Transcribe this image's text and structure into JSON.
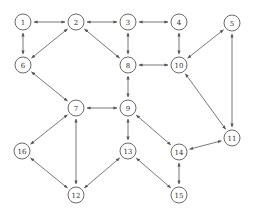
{
  "diagram": {
    "type": "directed-graph",
    "edge_style": "bidirectional-arrows",
    "colors": {
      "stroke": "#555555",
      "node_fill": "#ffffff",
      "text": "#333333"
    },
    "node_radius": 8,
    "nodes": [
      {
        "id": "1",
        "label": "1",
        "x": 23,
        "y": 22
      },
      {
        "id": "2",
        "label": "2",
        "x": 76,
        "y": 22
      },
      {
        "id": "3",
        "label": "3",
        "x": 128,
        "y": 22
      },
      {
        "id": "4",
        "label": "4",
        "x": 179,
        "y": 22
      },
      {
        "id": "5",
        "label": "5",
        "x": 232,
        "y": 23
      },
      {
        "id": "6",
        "label": "6",
        "x": 23,
        "y": 65
      },
      {
        "id": "7",
        "label": "7",
        "x": 76,
        "y": 108
      },
      {
        "id": "8",
        "label": "8",
        "x": 128,
        "y": 65
      },
      {
        "id": "9",
        "label": "9",
        "x": 128,
        "y": 108
      },
      {
        "id": "10",
        "label": "10",
        "x": 179,
        "y": 65
      },
      {
        "id": "11",
        "label": "11",
        "x": 232,
        "y": 138
      },
      {
        "id": "12",
        "label": "12",
        "x": 76,
        "y": 195
      },
      {
        "id": "13",
        "label": "13",
        "x": 128,
        "y": 151
      },
      {
        "id": "14",
        "label": "14",
        "x": 179,
        "y": 152
      },
      {
        "id": "15",
        "label": "15",
        "x": 179,
        "y": 195
      },
      {
        "id": "16",
        "label": "16",
        "x": 22,
        "y": 151
      }
    ],
    "edges": [
      {
        "from": "1",
        "to": "2"
      },
      {
        "from": "2",
        "to": "3"
      },
      {
        "from": "3",
        "to": "4"
      },
      {
        "from": "1",
        "to": "6"
      },
      {
        "from": "2",
        "to": "6"
      },
      {
        "from": "2",
        "to": "8"
      },
      {
        "from": "3",
        "to": "8"
      },
      {
        "from": "4",
        "to": "10"
      },
      {
        "from": "8",
        "to": "10"
      },
      {
        "from": "5",
        "to": "10"
      },
      {
        "from": "5",
        "to": "11"
      },
      {
        "from": "10",
        "to": "11"
      },
      {
        "from": "6",
        "to": "7"
      },
      {
        "from": "7",
        "to": "9"
      },
      {
        "from": "8",
        "to": "9"
      },
      {
        "from": "9",
        "to": "13"
      },
      {
        "from": "9",
        "to": "14"
      },
      {
        "from": "11",
        "to": "14"
      },
      {
        "from": "7",
        "to": "16"
      },
      {
        "from": "7",
        "to": "12"
      },
      {
        "from": "16",
        "to": "12"
      },
      {
        "from": "12",
        "to": "13"
      },
      {
        "from": "13",
        "to": "15"
      },
      {
        "from": "14",
        "to": "15"
      }
    ]
  }
}
